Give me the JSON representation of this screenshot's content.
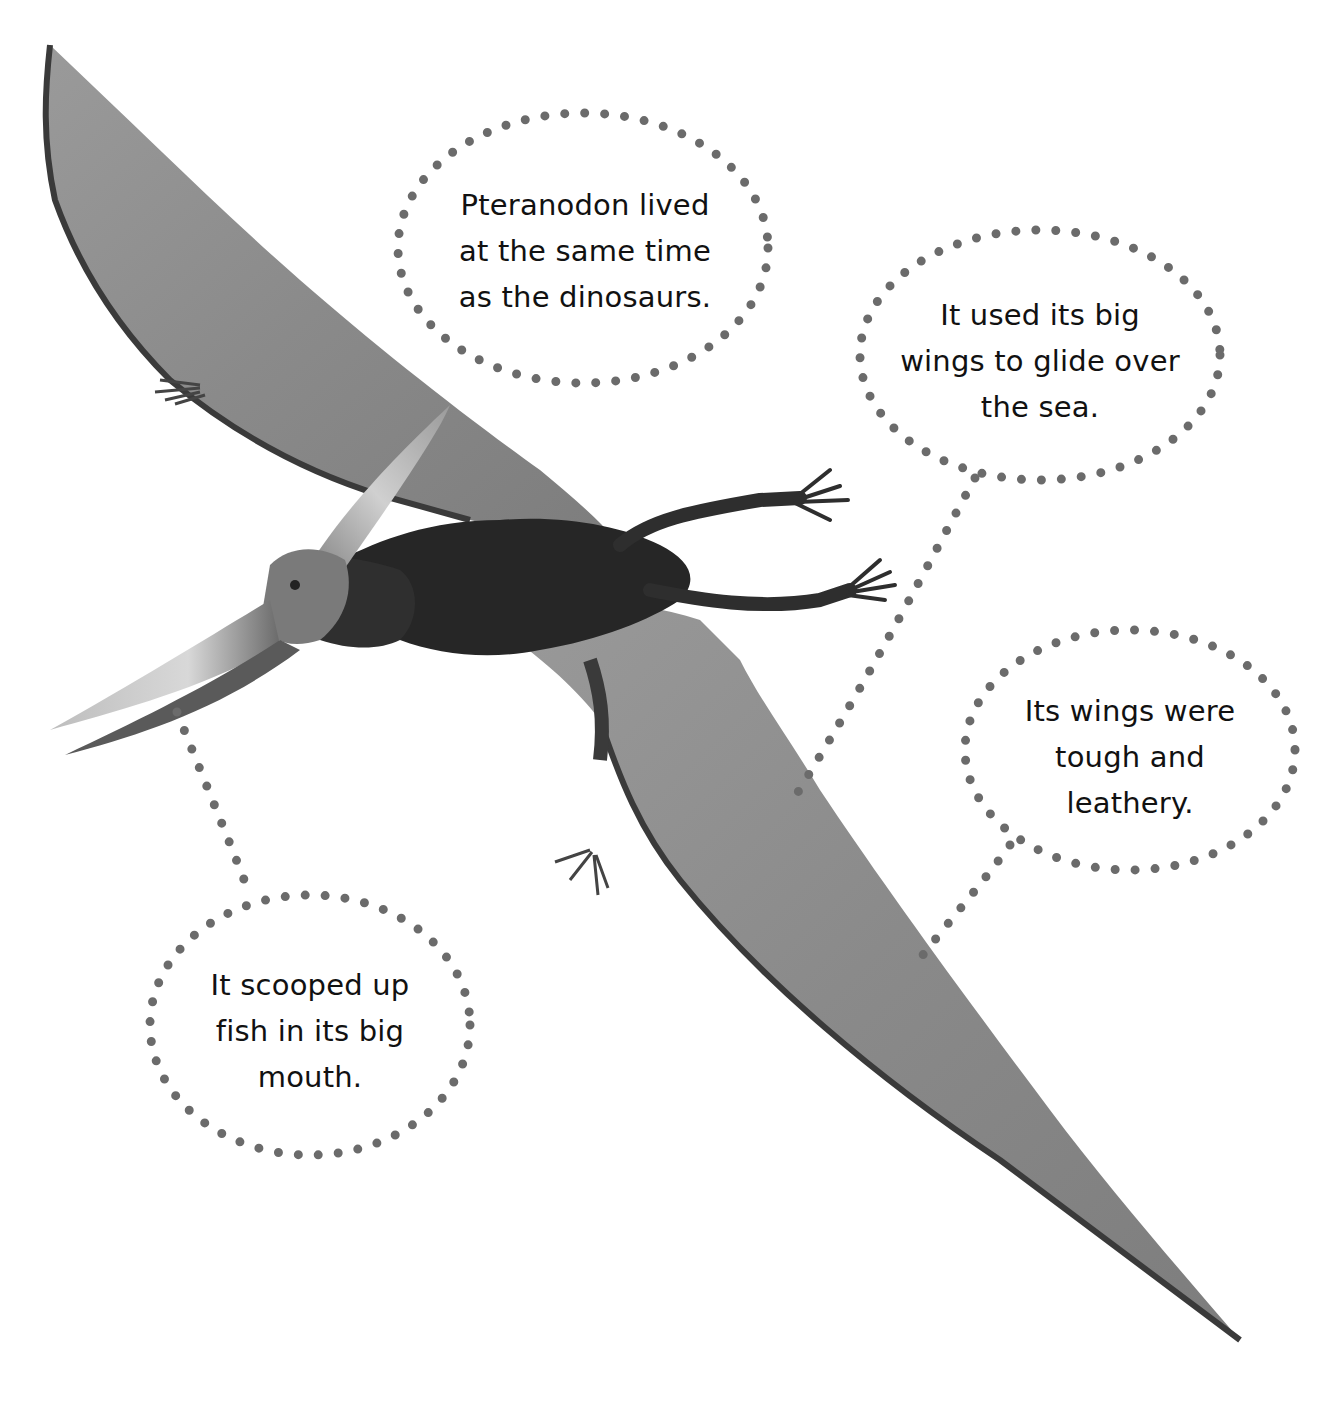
{
  "page": {
    "background": "#ffffff",
    "dot_color": "#6b6b6b",
    "wing_color": "#8a8a8a",
    "body_color": "#2a2a2a"
  },
  "callouts": [
    {
      "id": "lived",
      "lines": [
        "Pteranodon lived",
        "at the same time",
        "as the dinosaurs."
      ]
    },
    {
      "id": "glide",
      "lines": [
        "It used its big",
        "wings to glide over",
        "the sea."
      ]
    },
    {
      "id": "leathery",
      "lines": [
        "Its wings were",
        "tough and",
        "leathery."
      ]
    },
    {
      "id": "fish",
      "lines": [
        "It scooped up",
        "fish in its big",
        "mouth."
      ]
    }
  ]
}
